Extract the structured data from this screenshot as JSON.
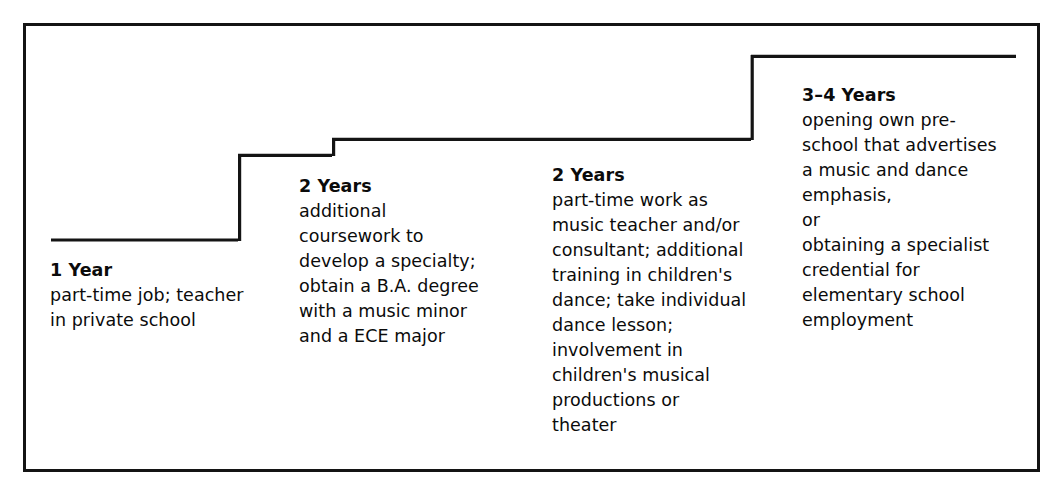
{
  "diagram": {
    "type": "staircase-career-ladder",
    "line_color": "#141414",
    "text_color": "#0b0b0b",
    "background_color": "#ffffff",
    "steps": [
      {
        "id": "step-1",
        "duration": "1 Year",
        "description": "part-time job; teacher\nin private school"
      },
      {
        "id": "step-2",
        "duration": "2 Years",
        "description": "additional\ncoursework to\ndevelop a specialty;\nobtain a B.A. degree\nwith a music minor\nand a ECE major"
      },
      {
        "id": "step-3",
        "duration": "2 Years",
        "description": "part-time work as\nmusic teacher and/or\nconsultant; additional\ntraining in children's\ndance; take individual\ndance lesson;\ninvolvement in\nchildren's musical\nproductions or\ntheater"
      },
      {
        "id": "step-4",
        "duration": "3–4 Years",
        "description_before_or": "opening own pre-\nschool that advertises\na music and dance\nemphasis,",
        "or_label": "or",
        "description_after_or": "obtaining a specialist\ncredential for\nelementary school\nemployment"
      }
    ]
  }
}
